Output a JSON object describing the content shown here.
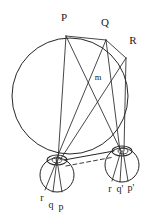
{
  "figure": {
    "kind": "geometry-diagram",
    "background_color": "#ffffff",
    "stroke_color": "#262626",
    "label_color": "#1a1a1a",
    "width": 154,
    "height": 219
  },
  "labels": {
    "P": "P",
    "Q": "Q",
    "R": "R",
    "m": "m",
    "r": "r",
    "q": "q",
    "p": "p",
    "r_prime": "r",
    "q_prime": "q'",
    "p_prime": "p'"
  },
  "geometry": {
    "main_circle": {
      "cx": 70,
      "cy": 96,
      "r": 58
    },
    "left_circle": {
      "cx": 57,
      "cy": 175,
      "r": 17
    },
    "right_circle": {
      "cx": 122,
      "cy": 165,
      "r": 17
    },
    "left_node": {
      "cx": 57,
      "cy": 160,
      "rx": 10,
      "ry": 5
    },
    "right_node": {
      "cx": 122,
      "cy": 151,
      "rx": 10,
      "ry": 5
    },
    "points": {
      "P": {
        "x": 66,
        "y": 36
      },
      "Q": {
        "x": 106,
        "y": 40
      },
      "R": {
        "x": 126,
        "y": 58
      },
      "m": {
        "x": 98,
        "y": 78
      }
    },
    "label_positions": {
      "P": {
        "x": 64,
        "y": 18
      },
      "Q": {
        "x": 105,
        "y": 23
      },
      "R": {
        "x": 133,
        "y": 41
      },
      "m": {
        "x": 98,
        "y": 78
      },
      "r": {
        "x": 42,
        "y": 199
      },
      "q": {
        "x": 51,
        "y": 205
      },
      "p": {
        "x": 61,
        "y": 207
      },
      "r_prime": {
        "x": 110,
        "y": 190
      },
      "q_prime": {
        "x": 120,
        "y": 190
      },
      "p_prime": {
        "x": 131,
        "y": 189
      }
    }
  }
}
